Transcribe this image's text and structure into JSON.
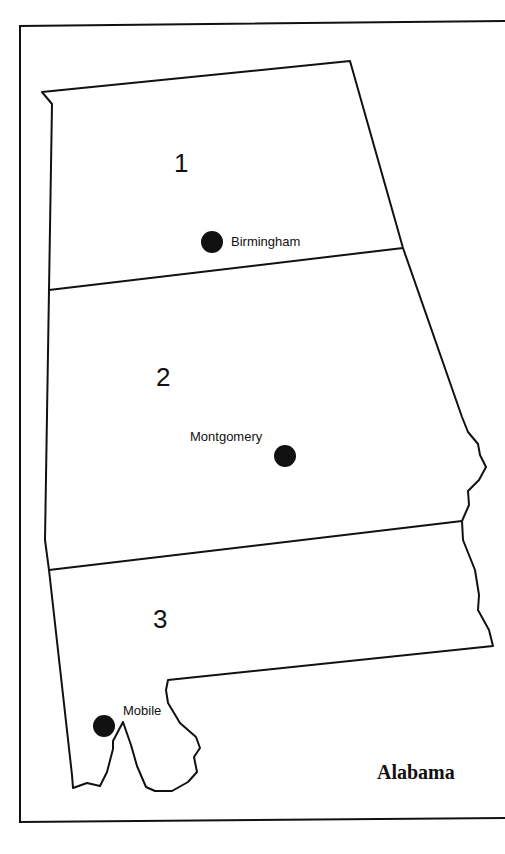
{
  "map": {
    "title": "Alabama",
    "regions": [
      {
        "number": "1"
      },
      {
        "number": "2"
      },
      {
        "number": "3"
      }
    ],
    "cities": [
      {
        "name": "Birmingham",
        "region": "1"
      },
      {
        "name": "Montgomery",
        "region": "2"
      },
      {
        "name": "Mobile",
        "region": "3"
      }
    ],
    "colors": {
      "ink": "#111111",
      "background": "#ffffff"
    }
  }
}
